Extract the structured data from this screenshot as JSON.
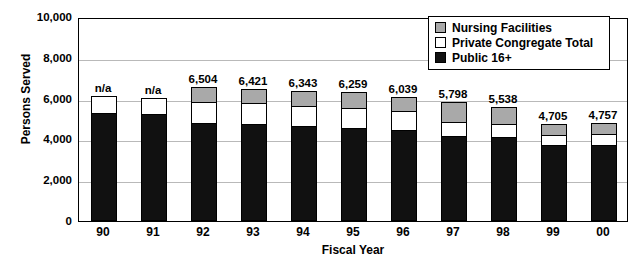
{
  "chart_data": {
    "type": "bar",
    "title": "",
    "xlabel": "Fiscal Year",
    "ylabel": "Persons Served",
    "ylim": [
      0,
      10000
    ],
    "ytick_labels": [
      "10,000",
      "8,000",
      "6,000",
      "4,000",
      "2,000",
      "0"
    ],
    "ytick_values": [
      10000,
      8000,
      6000,
      4000,
      2000,
      0
    ],
    "grid": true,
    "stacked": true,
    "legend_position": "top-right",
    "categories": [
      "90",
      "91",
      "92",
      "93",
      "94",
      "95",
      "96",
      "97",
      "98",
      "99",
      "00"
    ],
    "total_labels": [
      "n/a",
      "n/a",
      "6,504",
      "6,421",
      "6,343",
      "6,259",
      "6,039",
      "5,798",
      "5,538",
      "4,705",
      "4,757"
    ],
    "totals": [
      null,
      null,
      6504,
      6421,
      6343,
      6259,
      6039,
      5798,
      5538,
      4705,
      4757
    ],
    "series": [
      {
        "name": "Public 16+",
        "color": "#111111",
        "values": [
          5250,
          5200,
          4770,
          4730,
          4600,
          4490,
          4390,
          4120,
          4070,
          3680,
          3660
        ]
      },
      {
        "name": "Private Congregate Total",
        "color": "#ffffff",
        "values": [
          830,
          770,
          1010,
          1000,
          1010,
          1020,
          940,
          690,
          640,
          490,
          560
        ]
      },
      {
        "name": "Nursing Facilities",
        "color": "#a9a9a9",
        "values": [
          0,
          0,
          724,
          691,
          733,
          749,
          709,
          988,
          828,
          535,
          537
        ]
      }
    ]
  },
  "legend": {
    "items": [
      {
        "label": "Nursing Facilities",
        "color": "#a9a9a9"
      },
      {
        "label": "Private Congregate Total",
        "color": "#ffffff"
      },
      {
        "label": "Public 16+",
        "color": "#111111"
      }
    ]
  }
}
